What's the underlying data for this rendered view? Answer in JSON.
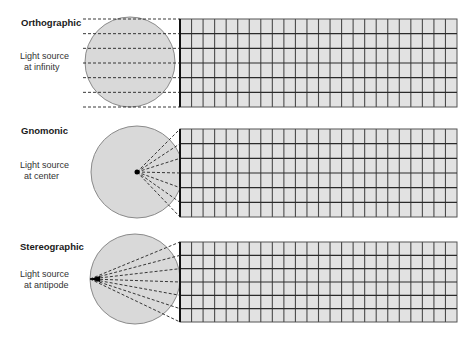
{
  "colors": {
    "globe_fill": "#d9d9d9",
    "globe_stroke": "#8a8a8a",
    "grid_fill": "#e2e2e2",
    "grid_line": "#2a2a2a",
    "ray": "#222222"
  },
  "grid": {
    "columns": 24,
    "rows": 6
  },
  "panels": [
    {
      "title": "Orthographic",
      "light_line1": "Light source",
      "light_line2": "at infinity"
    },
    {
      "title": "Gnomonic",
      "light_line1": "Light source",
      "light_line2": "at center"
    },
    {
      "title": "Stereographic",
      "light_line1": "Light source",
      "light_line2": "at antipode"
    }
  ]
}
